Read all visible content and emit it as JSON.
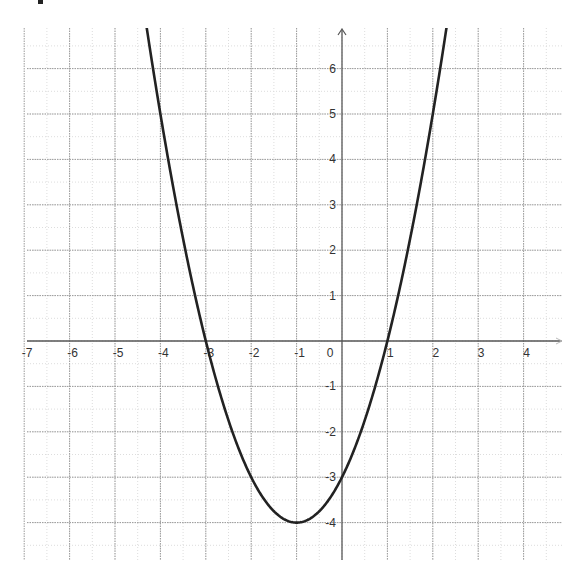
{
  "chart_data": {
    "type": "line",
    "title": "",
    "xlabel": "",
    "ylabel": "",
    "function": "y = x^2 + 2x - 3",
    "vertex": [
      -1,
      -4
    ],
    "roots": [
      -3,
      1
    ],
    "y_intercept": -3,
    "xlim": [
      -7,
      4.8
    ],
    "ylim": [
      -4.7,
      6.8
    ],
    "grid": true,
    "minor_grid": true,
    "x_ticks": [
      -7,
      -6,
      -5,
      -4,
      -3,
      -2,
      -1,
      0,
      1,
      2,
      3,
      4
    ],
    "y_ticks": [
      -4,
      -3,
      -2,
      -1,
      1,
      2,
      3,
      4,
      5,
      6
    ],
    "x_tick_labels": [
      "-7",
      "-6",
      "-5",
      "-4",
      "-3",
      "-2",
      "-1",
      "0",
      "1",
      "2",
      "3",
      "4"
    ],
    "y_tick_labels": [
      "-4",
      "-3",
      "-2",
      "-1",
      "1",
      "2",
      "3",
      "4",
      "5",
      "6"
    ],
    "series": [
      {
        "name": "parabola",
        "x": [
          -4.3,
          -4,
          -3.5,
          -3,
          -2.5,
          -2,
          -1.5,
          -1,
          -0.5,
          0,
          0.5,
          1,
          1.5,
          2,
          2.3
        ],
        "y": [
          6.19,
          5,
          2.25,
          0,
          -1.75,
          -3,
          -3.75,
          -4,
          -3.75,
          -3,
          -1.75,
          0,
          2.25,
          5,
          6.89
        ]
      }
    ],
    "colors": {
      "curve": "#222222",
      "axis": "#555555",
      "major_grid": "#9a9a9a",
      "minor_grid": "#dddddd"
    }
  },
  "layout": {
    "origin_px": [
      342,
      341
    ],
    "unit_px": 45.4,
    "plot_left": 27,
    "plot_top": 28,
    "plot_right": 562,
    "plot_bottom": 560
  }
}
